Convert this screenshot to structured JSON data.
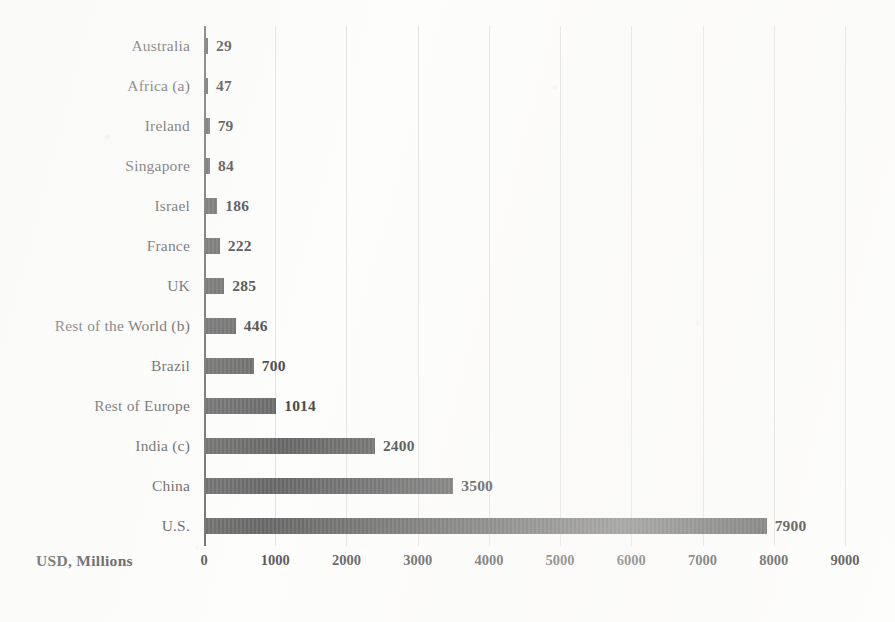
{
  "chart_data": {
    "type": "bar",
    "orientation": "horizontal",
    "title": "",
    "xlabel": "USD, Millions",
    "ylabel": "",
    "xlim": [
      0,
      9000
    ],
    "xticks": [
      0,
      1000,
      2000,
      3000,
      4000,
      5000,
      6000,
      7000,
      8000,
      9000
    ],
    "xtick_labels": [
      "0",
      "1000",
      "2000",
      "3000",
      "4000",
      "5000",
      "6000",
      "7000",
      "8000",
      "9000"
    ],
    "grid": true,
    "grid_axis": "x",
    "legend": false,
    "bar_color": "#6b6b6b",
    "value_labels": true,
    "categories": [
      "Australia",
      "Africa (a)",
      "Ireland",
      "Singapore",
      "Israel",
      "France",
      "UK",
      "Rest of the World (b)",
      "Brazil",
      "Rest of Europe",
      "India (c)",
      "China",
      "U.S."
    ],
    "values": [
      29,
      47,
      79,
      84,
      186,
      222,
      285,
      446,
      700,
      1014,
      2400,
      3500,
      7900
    ],
    "value_labels_text": [
      "29",
      "47",
      "79",
      "84",
      "186",
      "222",
      "285",
      "446",
      "700",
      "1014",
      "2400",
      "3500",
      "7900"
    ]
  },
  "axis": {
    "title": "USD, Millions"
  }
}
